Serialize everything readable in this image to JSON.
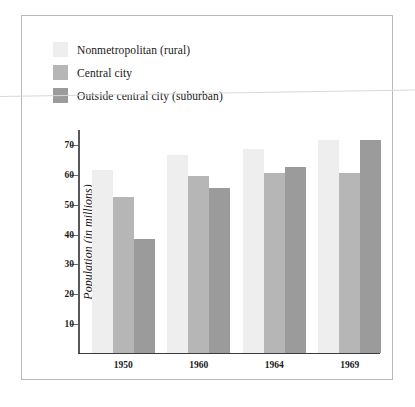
{
  "figure": {
    "border_color": "#b9b9b9",
    "background": "#ffffff"
  },
  "legend": {
    "position": "top-left",
    "items": [
      {
        "label": "Nonmetropolitan (rural)",
        "color": "#eeeeee"
      },
      {
        "label": "Central city",
        "color": "#b6b6b6"
      },
      {
        "label": "Outside central city (suburban)",
        "color": "#9b9b9b"
      }
    ]
  },
  "chart_data": {
    "type": "bar",
    "title": "",
    "xlabel": "",
    "ylabel": "Population (in millions)",
    "categories": [
      "1950",
      "1960",
      "1964",
      "1969"
    ],
    "series": [
      {
        "name": "Nonmetropolitan (rural)",
        "color": "#eeeeee",
        "values": [
          61,
          66,
          68,
          71
        ]
      },
      {
        "name": "Central city",
        "color": "#b6b6b6",
        "values": [
          52,
          59,
          60,
          60
        ]
      },
      {
        "name": "Outside central city (suburban)",
        "color": "#9b9b9b",
        "values": [
          38,
          55,
          62,
          71
        ]
      }
    ],
    "ylim": [
      0,
      75
    ],
    "yticks": [
      10,
      20,
      30,
      40,
      50,
      60,
      70
    ],
    "ytick_labels": [
      "10",
      "20",
      "30",
      "40",
      "50",
      "60",
      "70"
    ],
    "grid": false,
    "legend_position": "top-left"
  }
}
